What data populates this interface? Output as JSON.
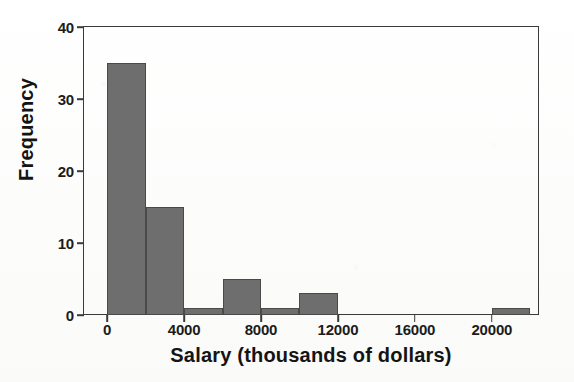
{
  "chart_data": {
    "type": "bar",
    "title": "",
    "xlabel": "Salary (thousands of dollars)",
    "ylabel": "Frequency",
    "bin_width": 2000,
    "bin_starts": [
      0,
      2000,
      4000,
      6000,
      8000,
      10000,
      12000,
      14000,
      16000,
      18000,
      20000
    ],
    "categories": [
      "0-2000",
      "2000-4000",
      "4000-6000",
      "6000-8000",
      "8000-10000",
      "10000-12000",
      "12000-14000",
      "14000-16000",
      "16000-18000",
      "18000-20000",
      "20000-22000"
    ],
    "values": [
      35,
      15,
      1,
      5,
      1,
      3,
      0,
      0,
      0,
      0,
      1
    ],
    "xlim": [
      -1200,
      22400
    ],
    "ylim": [
      0,
      40
    ],
    "xticks": [
      0,
      4000,
      8000,
      12000,
      16000,
      20000
    ],
    "xtick_labels": [
      "0",
      "4000",
      "8000",
      "12000",
      "16000",
      "20000"
    ],
    "yticks": [
      0,
      10,
      20,
      30,
      40
    ],
    "ytick_labels": [
      "0",
      "10",
      "20",
      "30",
      "40"
    ],
    "grid": false,
    "legend": false,
    "legend_position": "none",
    "bar_color": "#6e6e6e",
    "bar_edge_color": "#4a4a4a",
    "frame_color": "#3a3a3a",
    "text_color": "#141414"
  }
}
